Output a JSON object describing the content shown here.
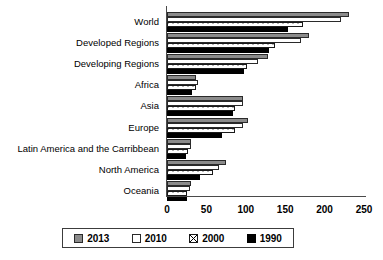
{
  "chart_data": {
    "type": "bar",
    "orientation": "horizontal",
    "title": "",
    "subtitle": "",
    "xlabel": "",
    "ylabel": "",
    "xlim": [
      0,
      250
    ],
    "ylim": null,
    "grid": false,
    "legend_position": "bottom",
    "xticks": [
      0,
      50,
      100,
      150,
      200,
      250
    ],
    "categories": [
      "World",
      "Developed Regions",
      "Developing Regions",
      "Africa",
      "Asia",
      "Europe",
      "Latin America and the Carribbean",
      "North America",
      "Oceania"
    ],
    "series": [
      {
        "name": "2013",
        "color": "#8b8b8b",
        "pattern": "solid-gray",
        "values": [
          231,
          180,
          128,
          37,
          96,
          103,
          31,
          75,
          30
        ]
      },
      {
        "name": "2010",
        "color": "#ffffff",
        "pattern": "solid-white",
        "values": [
          221,
          170,
          115,
          39,
          96,
          96,
          30,
          66,
          29
        ]
      },
      {
        "name": "2000",
        "color": "#ffffff",
        "pattern": "crosshatch-boxed-x",
        "values": [
          173,
          137,
          102,
          37,
          86,
          86,
          27,
          58,
          26
        ]
      },
      {
        "name": "1990",
        "color": "#000000",
        "pattern": "solid-black",
        "values": [
          154,
          130,
          98,
          32,
          84,
          70,
          24,
          42,
          25
        ]
      }
    ]
  },
  "legend": {
    "items": [
      {
        "label": "2013",
        "swatch": "solid-gray-swatch"
      },
      {
        "label": "2010",
        "swatch": "solid-white-swatch"
      },
      {
        "label": "2000",
        "swatch": "crosshatch-swatch"
      },
      {
        "label": "1990",
        "swatch": "solid-black-swatch"
      }
    ]
  }
}
